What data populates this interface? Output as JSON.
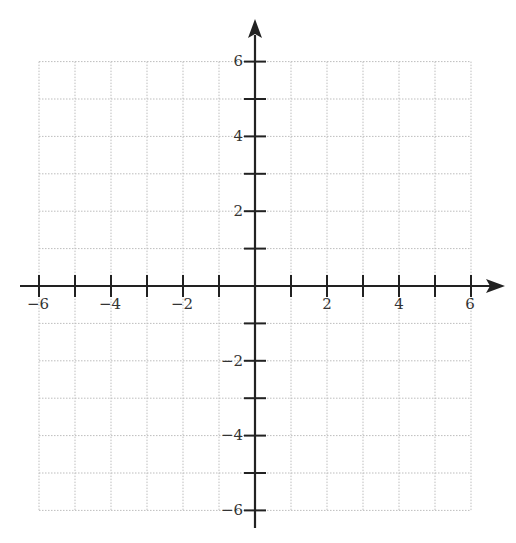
{
  "chart_data": {
    "type": "scatter",
    "title": "",
    "xlabel": "",
    "ylabel": "",
    "xlim": [
      -6,
      6
    ],
    "ylim": [
      -6,
      6
    ],
    "grid": true,
    "grid_style": "dotted",
    "grid_step": 1,
    "x_ticks": [
      -6,
      -5,
      -4,
      -3,
      -2,
      -1,
      1,
      2,
      3,
      4,
      5,
      6
    ],
    "y_ticks": [
      -6,
      -5,
      -4,
      -3,
      -2,
      -1,
      1,
      2,
      3,
      4,
      5,
      6
    ],
    "x_tick_labels": [
      "−6",
      "−4",
      "−2",
      "2",
      "4",
      "6"
    ],
    "y_tick_labels": [
      "6",
      "4",
      "2",
      "−2",
      "−4",
      "−6"
    ],
    "series": [],
    "legend": null,
    "axes": {
      "x_arrow": true,
      "y_arrow": true,
      "cartesian_plane": true
    }
  },
  "labels": {
    "x": [
      "−6",
      "−4",
      "−2",
      "2",
      "4",
      "6"
    ],
    "y": [
      "6",
      "4",
      "2",
      "−2",
      "−4",
      "−6"
    ]
  },
  "colors": {
    "axis": "#222222",
    "grid": "#bdbdbd",
    "text": "#333333",
    "background": "#ffffff"
  }
}
